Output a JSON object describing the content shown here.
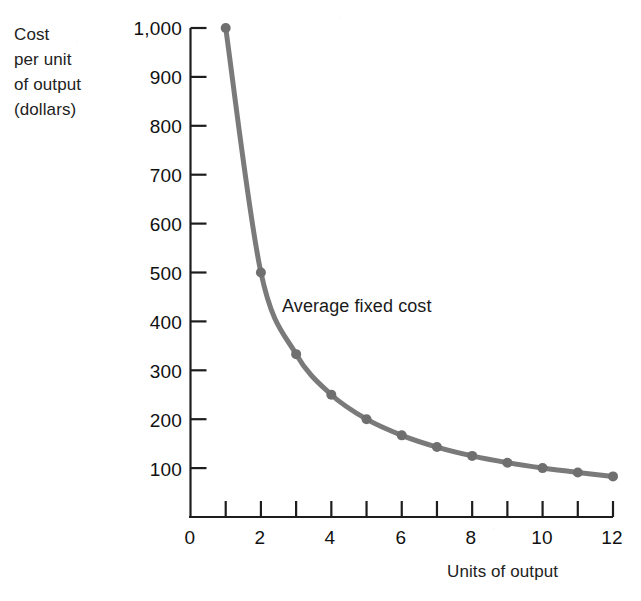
{
  "chart_data": {
    "type": "line",
    "title": "",
    "subtitle": "",
    "xlabel": "Units of output",
    "ylabel": "Cost per unit of output (dollars)",
    "ylabel_lines": [
      "Cost",
      "per unit",
      "of output",
      "(dollars)"
    ],
    "x": [
      1,
      2,
      3,
      4,
      5,
      6,
      7,
      8,
      9,
      10,
      11,
      12
    ],
    "values": [
      1000,
      500,
      333,
      250,
      200,
      167,
      143,
      125,
      111,
      100,
      91,
      83
    ],
    "series": [
      {
        "name": "Average fixed cost",
        "values": [
          1000,
          500,
          333,
          250,
          200,
          167,
          143,
          125,
          111,
          100,
          91,
          83
        ]
      }
    ],
    "annotations": [
      {
        "text": "Average fixed cost",
        "x": 3.6,
        "y": 430
      }
    ],
    "xlim": [
      0,
      12
    ],
    "ylim": [
      0,
      1000
    ],
    "xticks": [
      0,
      1,
      2,
      3,
      4,
      5,
      6,
      7,
      8,
      9,
      10,
      11,
      12
    ],
    "xtick_labels": [
      "0",
      "",
      "2",
      "",
      "4",
      "",
      "6",
      "",
      "8",
      "",
      "10",
      "",
      "12"
    ],
    "yticks": [
      0,
      100,
      200,
      300,
      400,
      500,
      600,
      700,
      800,
      900,
      1000
    ],
    "ytick_labels": [
      "0",
      "100",
      "200",
      "300",
      "400",
      "500",
      "600",
      "700",
      "800",
      "900",
      "1,000"
    ],
    "grid": false,
    "legend": false,
    "legend_position": "none",
    "marker": "circle",
    "colors": {
      "curve": "#7a7a7a",
      "marker": "#6f6f6f",
      "axis": "#1d1d1d",
      "text": "#1a1a1a",
      "background": "#ffffff"
    }
  },
  "axis": {
    "y_label_lines": [
      "Cost",
      "per unit",
      "of output",
      "(dollars)"
    ],
    "x_title": "Units of output",
    "y_tick_labels": [
      "1,000",
      "900",
      "800",
      "700",
      "600",
      "500",
      "400",
      "300",
      "200",
      "100",
      "0"
    ],
    "x_tick_labels": [
      "0",
      "2",
      "4",
      "6",
      "8",
      "10",
      "12"
    ]
  },
  "annotation": {
    "series_label": "Average fixed cost"
  }
}
